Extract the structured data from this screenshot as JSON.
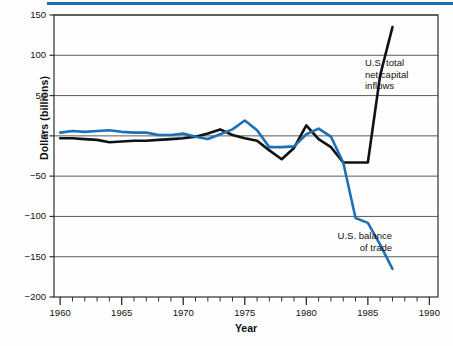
{
  "figure": {
    "accent_color": "#1f6fb5",
    "background": "#fefefe"
  },
  "chart_data": {
    "type": "line",
    "title": "",
    "xlabel": "Year",
    "ylabel": "Dollars (billions)",
    "xlim": [
      1959.5,
      1990.7
    ],
    "ylim": [
      -200,
      150
    ],
    "xticks": [
      1960,
      1965,
      1970,
      1975,
      1980,
      1985,
      1990
    ],
    "xtick_labels": [
      "1960",
      "1965",
      "1970",
      "1975",
      "1980",
      "1985",
      "1990"
    ],
    "minor_xtick_interval": 1,
    "yticks": [
      150,
      100,
      50,
      0,
      -50,
      -100,
      -150,
      -200
    ],
    "ytick_labels": [
      "150",
      "100",
      "50",
      "0",
      "−50",
      "−100",
      "−150",
      "−200"
    ],
    "grid": "horizontal",
    "legend_position": "inline-annotations",
    "series": [
      {
        "name": "U.S. total net capital inflows",
        "label": "U.S. total\nnet capital\ninflows",
        "color": "#111111",
        "linewidth": 2.6,
        "x": [
          1960,
          1961,
          1962,
          1963,
          1964,
          1965,
          1966,
          1967,
          1968,
          1969,
          1970,
          1971,
          1972,
          1973,
          1974,
          1975,
          1976,
          1977,
          1978,
          1979,
          1980,
          1981,
          1982,
          1983,
          1984,
          1985,
          1986,
          1987
        ],
        "values": [
          -3,
          -3,
          -4,
          -5,
          -8,
          -7,
          -6,
          -6,
          -5,
          -4,
          -3,
          -1,
          3,
          8,
          1,
          -3,
          -6,
          -18,
          -29,
          -15,
          13,
          -4,
          -14,
          -33,
          -33,
          -33,
          75,
          135
        ]
      },
      {
        "name": "U.S. balance of trade",
        "label": "U.S. balance\nof trade",
        "color": "#1f6fb5",
        "linewidth": 2.6,
        "x": [
          1960,
          1961,
          1962,
          1963,
          1964,
          1965,
          1966,
          1967,
          1968,
          1969,
          1970,
          1971,
          1972,
          1973,
          1974,
          1975,
          1976,
          1977,
          1978,
          1979,
          1980,
          1981,
          1982,
          1983,
          1984,
          1985,
          1986,
          1987
        ],
        "values": [
          4,
          6,
          5,
          6,
          7,
          5,
          4,
          4,
          1,
          1,
          3,
          -1,
          -4,
          2,
          8,
          19,
          7,
          -14,
          -14,
          -13,
          2,
          9,
          -1,
          -33,
          -102,
          -108,
          -135,
          -165
        ]
      }
    ]
  },
  "annotations": {
    "inflows": "U.S. total\nnet capital\ninflows",
    "trade": "U.S. balance\nof trade"
  }
}
